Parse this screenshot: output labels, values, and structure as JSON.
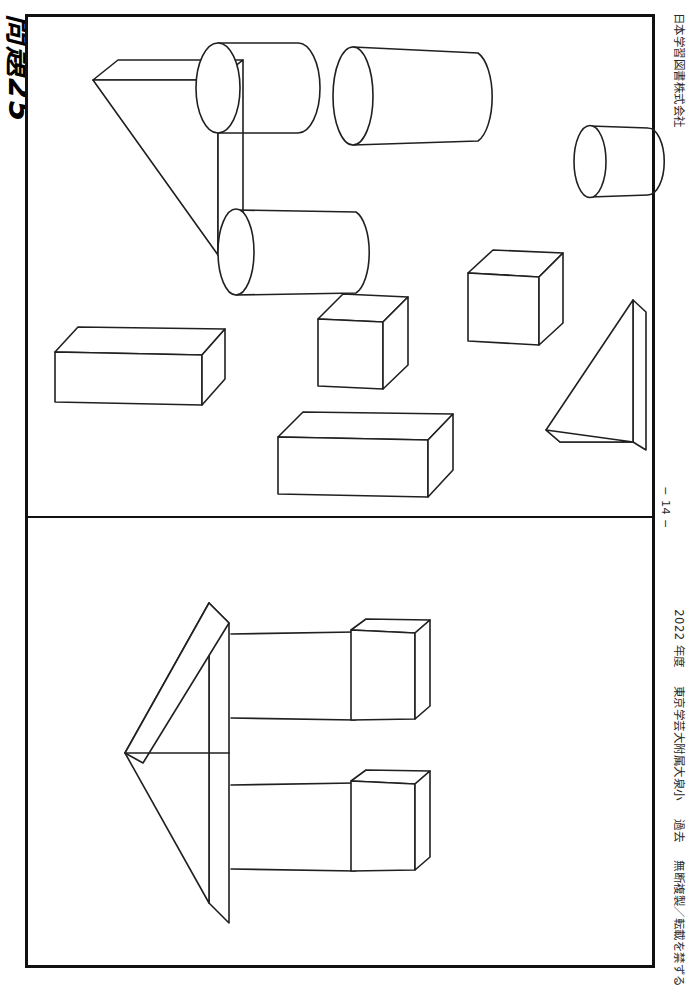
{
  "worksheet": {
    "title": "問題25",
    "publisher": "日本学習図書株式会社",
    "page_number": "− 14 −",
    "footer": {
      "year": "2022 年度",
      "school": "東京学芸大附属大泉小",
      "section": "過去",
      "copyright": "無断複製／転載を禁ずる"
    }
  },
  "panels": [
    {
      "id": "top-panel",
      "name": "solid-shapes-pool",
      "description": "Pool of individual 3-D solids drawn in outline",
      "figures": [
        {
          "name": "triangular-prism-large-left",
          "shape": "triangular prism",
          "x": 90,
          "y": 60
        },
        {
          "name": "cylinder-upper-left",
          "shape": "cylinder",
          "x": 195,
          "y": 36
        },
        {
          "name": "cylinder-upper-center",
          "shape": "cylinder",
          "x": 325,
          "y": 40
        },
        {
          "name": "cylinder-upper-right",
          "shape": "cylinder",
          "x": 566,
          "y": 120
        },
        {
          "name": "cylinder-middle-left",
          "shape": "cylinder",
          "x": 210,
          "y": 205
        },
        {
          "name": "cube-right",
          "shape": "cube",
          "x": 465,
          "y": 245
        },
        {
          "name": "cube-center",
          "shape": "cube",
          "x": 315,
          "y": 290
        },
        {
          "name": "cuboid-left",
          "shape": "rectangular prism",
          "x": 50,
          "y": 320
        },
        {
          "name": "cuboid-center-bottom",
          "shape": "rectangular prism",
          "x": 275,
          "y": 405
        },
        {
          "name": "triangular-prism-right",
          "shape": "triangular prism",
          "x": 545,
          "y": 295
        }
      ]
    },
    {
      "id": "bottom-panel",
      "name": "composite-assembly",
      "description": "Arrow-shaped assembly: triangular prism head with two cylinders, each capped by a cube",
      "figures": [
        {
          "name": "prism-arrow-head",
          "shape": "triangular prism"
        },
        {
          "name": "cylinder-upper-arm",
          "shape": "cylinder"
        },
        {
          "name": "cube-upper-tip",
          "shape": "cube"
        },
        {
          "name": "cylinder-lower-arm",
          "shape": "cylinder"
        },
        {
          "name": "cube-lower-tip",
          "shape": "cube"
        }
      ]
    }
  ]
}
